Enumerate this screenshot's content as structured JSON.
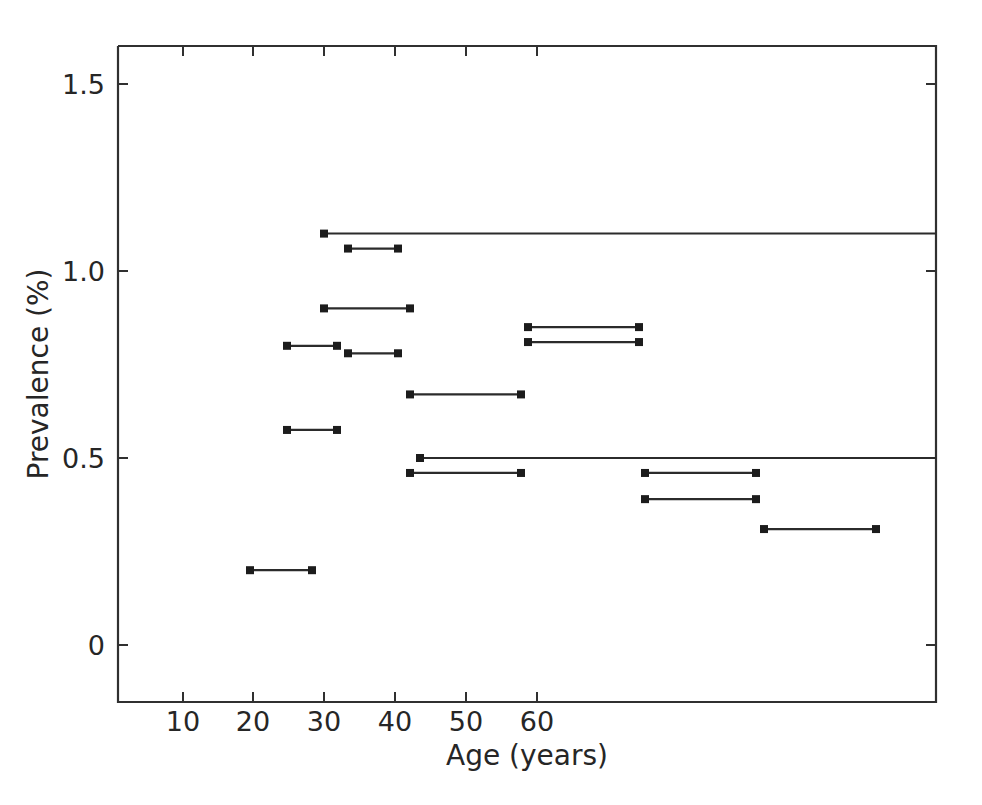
{
  "chart_data": {
    "type": "line",
    "title": "",
    "xlabel": "Age (years)",
    "ylabel": "Prevalence (%)",
    "xlim": [
      2,
      69
    ],
    "ylim": [
      -0.22,
      1.62
    ],
    "grid": false,
    "legend": null,
    "xticks": [
      10,
      20,
      30,
      40,
      50,
      60
    ],
    "xticklabels": [
      "10",
      "20",
      "30",
      "40",
      "50",
      "60"
    ],
    "yticks": [
      0,
      0.5,
      1.0,
      1.5
    ],
    "yticklabels": [
      "0",
      "0.5",
      "1.0",
      "1.5"
    ],
    "marker": "square-endpoints",
    "segments": [
      {
        "x_start": 30,
        "x_end": 69,
        "y": 1.1,
        "label": "1.10 over 30-69",
        "open_ended": true
      },
      {
        "x_start": 33,
        "x_end": 40,
        "y": 1.06,
        "label": "1.06 over 33-40"
      },
      {
        "x_start": 30,
        "x_end": 40,
        "y": 0.9,
        "label": "0.90 over 30-40"
      },
      {
        "x_start": 59,
        "x_end": 76,
        "y": 0.85,
        "label": "0.85 over 59-76"
      },
      {
        "x_start": 25,
        "x_end": 32,
        "y": 0.8,
        "label": "0.80 over 25-32"
      },
      {
        "x_start": 59,
        "x_end": 76,
        "y": 0.81,
        "label": "0.81 over 59-76"
      },
      {
        "x_start": 33,
        "x_end": 40,
        "y": 0.78,
        "label": "0.78 over 33-40"
      },
      {
        "x_start": 42,
        "x_end": 57,
        "y": 0.67,
        "label": "0.67 over 42-57"
      },
      {
        "x_start": 25,
        "x_end": 32,
        "y": 0.575,
        "label": "0.575 over 25-32"
      },
      {
        "x_start": 44,
        "x_end": 69,
        "y": 0.5,
        "label": "0.50 over 44-69",
        "open_ended": true
      },
      {
        "x_start": 42,
        "x_end": 57,
        "y": 0.46,
        "label": "0.46 over 42-57"
      },
      {
        "x_start": 77,
        "x_end": 93,
        "y": 0.46,
        "label": "0.46 over 77-93"
      },
      {
        "x_start": 77,
        "x_end": 93,
        "y": 0.39,
        "label": "0.39 over 77-93"
      },
      {
        "x_start": 94,
        "x_end": 110,
        "y": 0.31,
        "label": "0.31 over 94-110"
      },
      {
        "x_start": 21,
        "x_end": 29,
        "y": 0.2,
        "label": "0.20 over 21-29"
      }
    ],
    "segments_px": [
      {
        "x1": 324,
        "x2": 936,
        "y_val": 1.1
      },
      {
        "x1": 348,
        "x2": 398,
        "y_val": 1.06
      },
      {
        "x1": 324,
        "x2": 410,
        "y_val": 0.9
      },
      {
        "x1": 528,
        "x2": 639,
        "y_val": 0.85
      },
      {
        "x1": 287,
        "x2": 337,
        "y_val": 0.8
      },
      {
        "x1": 528,
        "x2": 639,
        "y_val": 0.81
      },
      {
        "x1": 348,
        "x2": 398,
        "y_val": 0.78
      },
      {
        "x1": 410,
        "x2": 521,
        "y_val": 0.67
      },
      {
        "x1": 287,
        "x2": 337,
        "y_val": 0.575
      },
      {
        "x1": 420,
        "x2": 936,
        "y_val": 0.5
      },
      {
        "x1": 410,
        "x2": 521,
        "y_val": 0.46
      },
      {
        "x1": 645,
        "x2": 756,
        "y_val": 0.46
      },
      {
        "x1": 645,
        "x2": 756,
        "y_val": 0.39
      },
      {
        "x1": 764,
        "x2": 876,
        "y_val": 0.31
      },
      {
        "x1": 250,
        "x2": 312,
        "y_val": 0.2
      }
    ]
  },
  "axes": {
    "x_axis_title": "Age (years)",
    "y_axis_title": "Prevalence (%)",
    "x_tick_labels": [
      "10",
      "20",
      "30",
      "40",
      "50",
      "60"
    ],
    "y_tick_labels": [
      "1.5",
      "1.0",
      "0.5",
      "0"
    ]
  },
  "colors": {
    "background": "#ffffff",
    "line": "#2b2b2b",
    "text": "#262626",
    "spine": "#303030"
  }
}
